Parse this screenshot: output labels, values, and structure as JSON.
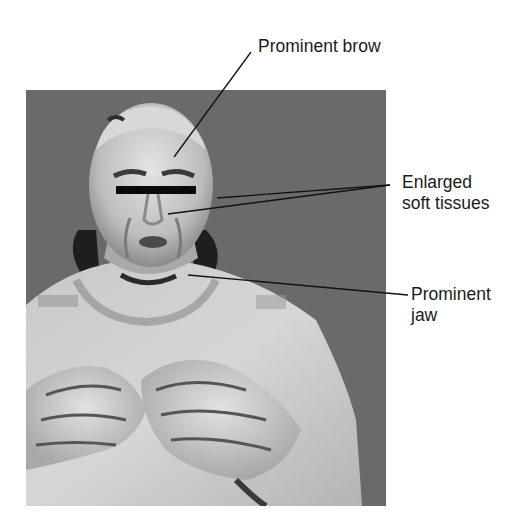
{
  "figure": {
    "background_color": "#6a6a6a",
    "labels": [
      {
        "id": "brow",
        "lines": [
          "Prominent brow"
        ]
      },
      {
        "id": "soft_tissues",
        "lines": [
          "Enlarged",
          "soft tissues"
        ]
      },
      {
        "id": "jaw",
        "lines": [
          "Prominent",
          "jaw"
        ]
      }
    ]
  }
}
